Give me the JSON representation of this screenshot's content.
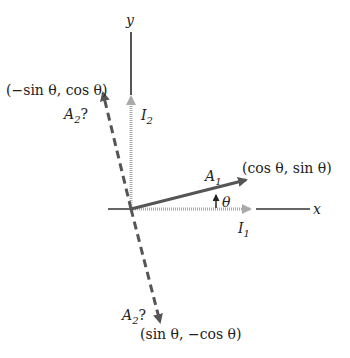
{
  "diagram": {
    "axes": {
      "x_label": "x",
      "y_label": "y"
    },
    "vectors": {
      "I1": {
        "name": "I",
        "sub": "1"
      },
      "I2": {
        "name": "I",
        "sub": "2"
      },
      "A1": {
        "name": "A",
        "sub": "1",
        "coords": "(cos θ, sin θ)"
      },
      "A2_up": {
        "name": "A",
        "sub": "2",
        "suffix": "?",
        "coords": "(−sin θ, cos θ)"
      },
      "A2_down": {
        "name": "A",
        "sub": "2",
        "suffix": "?",
        "coords": "(sin θ, −cos θ)"
      }
    },
    "angle_label": "θ",
    "colors": {
      "axis": "#555555",
      "unit_vectors": "#aaaaaa",
      "A_vectors": "#555555",
      "text": "#222222"
    }
  }
}
